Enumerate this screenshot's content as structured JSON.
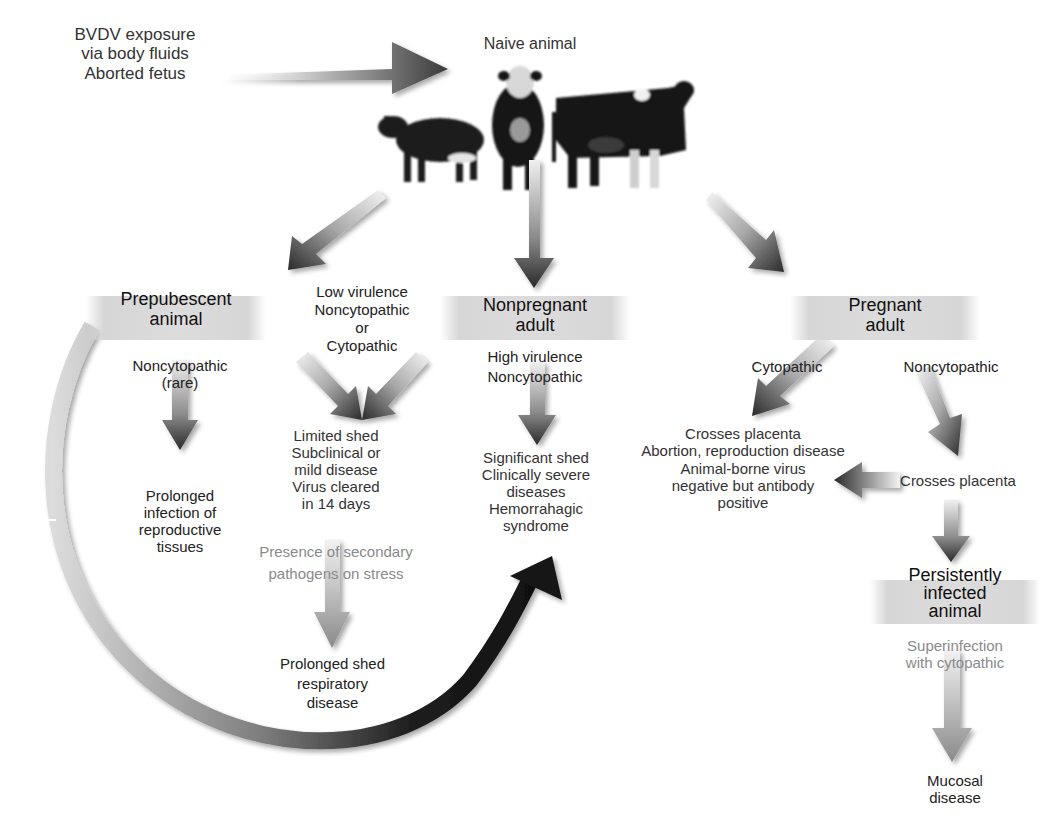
{
  "exposure": {
    "lines": [
      "BVDV exposure",
      "via body fluids",
      "Aborted fetus"
    ]
  },
  "naive": {
    "label": "Naive animal",
    "image_desc": "three cattle: calf, Hereford bull, Holstein cow"
  },
  "prepubescent": {
    "title": [
      "Prepubescent",
      "animal"
    ],
    "strain": [
      "Noncytopathic",
      "(rare)"
    ],
    "outcome": [
      "Prolonged",
      "infection of",
      "reproductive",
      "tissues"
    ]
  },
  "low_virulence": {
    "strain": [
      "Low virulence",
      "Noncytopathic",
      "or",
      "Cytopathic"
    ],
    "outcome": [
      "Limited shed",
      "Subclinical or",
      "mild disease",
      "Virus cleared",
      "in 14 days"
    ],
    "secondary": [
      "Presence of secondary",
      "pathogens on stress"
    ],
    "secondary_outcome": [
      "Prolonged shed",
      "respiratory",
      "disease"
    ]
  },
  "nonpregnant": {
    "title": [
      "Nonpregnant",
      "adult"
    ],
    "strain": [
      "High virulence",
      "Noncytopathic"
    ],
    "outcome": [
      "Significant shed",
      "Clinically severe",
      "diseases",
      "Hemorrahagic",
      "syndrome"
    ]
  },
  "pregnant": {
    "title": [
      "Pregnant",
      "adult"
    ],
    "cyto_label": "Cytopathic",
    "noncyto_label": "Noncytopathic",
    "cyto_outcome": [
      "Crosses placenta",
      "Abortion, reproduction disease",
      "Animal-borne virus",
      "negative but antibody",
      "positive"
    ],
    "noncyto_outcome": "Crosses placenta"
  },
  "persistent": {
    "title": [
      "Persistently",
      "infected",
      "animal"
    ],
    "superinfection": [
      "Superinfection",
      "with cytopathic"
    ],
    "outcome": [
      "Mucosal",
      "disease"
    ]
  },
  "colors": {
    "arrow_dark": "#2a2a2a",
    "arrow_light": "#e6e6e6",
    "band": "#d8d8d8",
    "text": "#222222",
    "text_light": "#8a8a8a"
  }
}
